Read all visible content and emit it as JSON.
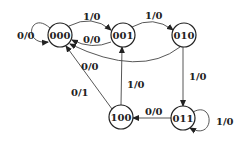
{
  "diagram": {
    "type": "state-machine",
    "nodes": [
      {
        "id": "s000",
        "label": "000",
        "x": 60,
        "y": 35
      },
      {
        "id": "s001",
        "label": "001",
        "x": 123,
        "y": 35
      },
      {
        "id": "s010",
        "label": "010",
        "x": 184,
        "y": 35
      },
      {
        "id": "s011",
        "label": "011",
        "x": 183,
        "y": 118
      },
      {
        "id": "s100",
        "label": "100",
        "x": 121,
        "y": 117
      }
    ],
    "edges": [
      {
        "from": "000",
        "to": "000",
        "label": "0/0"
      },
      {
        "from": "000",
        "to": "001",
        "label": "1/0"
      },
      {
        "from": "001",
        "to": "000",
        "label": "0/0"
      },
      {
        "from": "001",
        "to": "010",
        "label": "1/0"
      },
      {
        "from": "010",
        "to": "000",
        "label": "0/0"
      },
      {
        "from": "010",
        "to": "011",
        "label": "1/0"
      },
      {
        "from": "011",
        "to": "011",
        "label": "1/0"
      },
      {
        "from": "011",
        "to": "100",
        "label": "0/0"
      },
      {
        "from": "100",
        "to": "001",
        "label": "1/0"
      },
      {
        "from": "100",
        "to": "000",
        "label": "0/1"
      }
    ]
  }
}
